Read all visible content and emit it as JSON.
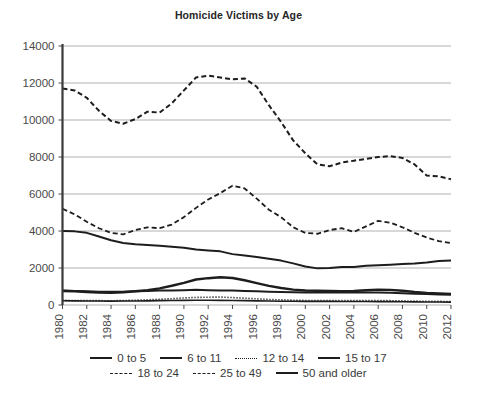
{
  "chart_data": {
    "type": "line",
    "title": "Homicide Victims by Age",
    "xlabel": "",
    "ylabel": "",
    "ylim": [
      0,
      14000
    ],
    "ytick_values": [
      0,
      2000,
      4000,
      6000,
      8000,
      10000,
      12000,
      14000
    ],
    "ytick_labels": [
      "0",
      "2000",
      "4000",
      "6000",
      "8000",
      "10000",
      "12000",
      "14000"
    ],
    "grid": true,
    "legend_position": "bottom",
    "x": [
      1980,
      1981,
      1982,
      1983,
      1984,
      1985,
      1986,
      1987,
      1988,
      1989,
      1990,
      1991,
      1992,
      1993,
      1994,
      1995,
      1996,
      1997,
      1998,
      1999,
      2000,
      2001,
      2002,
      2003,
      2004,
      2005,
      2006,
      2007,
      2008,
      2009,
      2010,
      2011,
      2012
    ],
    "xtick_labels": [
      "1980",
      "1982",
      "1984",
      "1986",
      "1988",
      "1990",
      "1992",
      "1994",
      "1996",
      "1998",
      "2000",
      "2002",
      "2004",
      "2006",
      "2008",
      "2010",
      "2012"
    ],
    "series": [
      {
        "name": "0 to 5",
        "style": "solid",
        "width": 2.0,
        "values": [
          780,
          760,
          740,
          720,
          710,
          720,
          740,
          760,
          780,
          790,
          800,
          820,
          800,
          790,
          780,
          760,
          740,
          720,
          700,
          690,
          670,
          680,
          690,
          680,
          670,
          680,
          670,
          660,
          640,
          610,
          590,
          570,
          560
        ]
      },
      {
        "name": "6 to 11",
        "style": "solid",
        "width": 1.6,
        "values": [
          230,
          225,
          220,
          215,
          210,
          215,
          220,
          225,
          235,
          240,
          250,
          260,
          255,
          250,
          245,
          235,
          225,
          215,
          205,
          200,
          195,
          195,
          195,
          190,
          190,
          190,
          185,
          180,
          175,
          170,
          165,
          160,
          155
        ]
      },
      {
        "name": "12 to 14",
        "style": "dotted",
        "width": 1.6,
        "values": [
          250,
          245,
          240,
          235,
          230,
          240,
          260,
          280,
          310,
          340,
          380,
          410,
          420,
          430,
          400,
          370,
          330,
          300,
          280,
          260,
          245,
          240,
          240,
          235,
          235,
          240,
          240,
          235,
          225,
          210,
          200,
          195,
          190
        ]
      },
      {
        "name": "15 to 17",
        "style": "solid",
        "width": 2.4,
        "values": [
          760,
          740,
          700,
          670,
          660,
          690,
          740,
          800,
          900,
          1040,
          1200,
          1380,
          1450,
          1500,
          1460,
          1340,
          1180,
          1030,
          920,
          830,
          780,
          770,
          760,
          740,
          760,
          800,
          830,
          820,
          770,
          700,
          650,
          620,
          600
        ]
      },
      {
        "name": "18 to 24",
        "style": "dashed",
        "width": 1.8,
        "values": [
          5200,
          4900,
          4500,
          4150,
          3900,
          3820,
          4050,
          4200,
          4150,
          4350,
          4750,
          5250,
          5700,
          6050,
          6450,
          6300,
          5750,
          5150,
          4750,
          4200,
          3900,
          3850,
          4050,
          4150,
          3950,
          4250,
          4550,
          4450,
          4200,
          3900,
          3650,
          3450,
          3350
        ]
      },
      {
        "name": "25 to 49",
        "style": "dashed",
        "width": 2.0,
        "values": [
          11700,
          11600,
          11200,
          10500,
          9950,
          9800,
          10050,
          10450,
          10400,
          10900,
          11600,
          12300,
          12400,
          12300,
          12200,
          12250,
          11800,
          10800,
          9900,
          8900,
          8200,
          7600,
          7500,
          7700,
          7800,
          7900,
          8000,
          8050,
          7950,
          7600,
          7000,
          6950,
          6800
        ]
      },
      {
        "name": "50 and older",
        "style": "solid",
        "width": 2.0,
        "values": [
          4000,
          3980,
          3900,
          3700,
          3500,
          3350,
          3280,
          3250,
          3200,
          3150,
          3100,
          3000,
          2950,
          2900,
          2750,
          2680,
          2600,
          2500,
          2400,
          2250,
          2080,
          1980,
          2000,
          2050,
          2060,
          2120,
          2150,
          2180,
          2220,
          2250,
          2300,
          2380,
          2400
        ]
      }
    ]
  },
  "legend": {
    "rows": [
      [
        {
          "label": "0 to 5",
          "style": "solid"
        },
        {
          "label": "6 to 11",
          "style": "solid"
        },
        {
          "label": "12 to 14",
          "style": "dotted"
        },
        {
          "label": "15 to 17",
          "style": "solid"
        }
      ],
      [
        {
          "label": "18 to 24",
          "style": "dashed"
        },
        {
          "label": "25 to 49",
          "style": "dashed"
        },
        {
          "label": "50 and older",
          "style": "solid"
        }
      ]
    ]
  },
  "colors": {
    "line": "#1d1d1d",
    "grid": "#a8a8a8",
    "axis": "#3a3a3a",
    "text": "#3a3a3a",
    "background": "#ffffff"
  }
}
